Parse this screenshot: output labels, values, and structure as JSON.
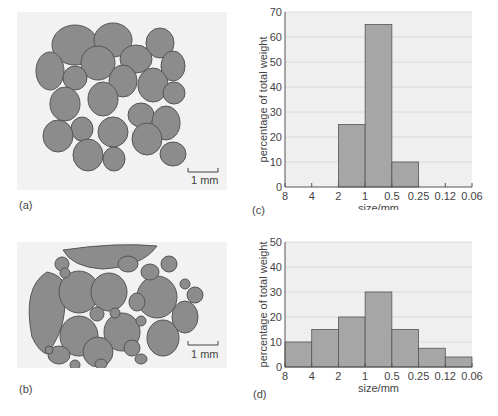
{
  "panels": {
    "a": {
      "label": "(a)",
      "scale_bar": "1 mm",
      "description": "well-sorted grains"
    },
    "b": {
      "label": "(b)",
      "scale_bar": "1 mm",
      "description": "poorly-sorted grains"
    },
    "c": {
      "label": "(c)"
    },
    "d": {
      "label": "(d)"
    }
  },
  "chart_data": [
    {
      "type": "bar",
      "panel": "(c)",
      "title": "",
      "xlabel": "size/mm",
      "ylabel": "percentage of total weight",
      "x_ticks": [
        "8",
        "4",
        "2",
        "1",
        "0.5",
        "0.25",
        "0.12",
        "0.06"
      ],
      "categories": [
        "8-4",
        "4-2",
        "2-1",
        "1-0.5",
        "0.5-0.25",
        "0.25-0.12",
        "0.12-0.06"
      ],
      "values": [
        0,
        0,
        25,
        65,
        10,
        0,
        0
      ],
      "ylim": [
        0,
        70
      ],
      "y_ticks": [
        0,
        10,
        20,
        30,
        40,
        50,
        60,
        70
      ],
      "grid": true
    },
    {
      "type": "bar",
      "panel": "(d)",
      "title": "",
      "xlabel": "size/mm",
      "ylabel": "percentage of total weight",
      "x_ticks": [
        "8",
        "4",
        "2",
        "1",
        "0.5",
        "0.25",
        "0.12",
        "0.06"
      ],
      "categories": [
        "8-4",
        "4-2",
        "2-1",
        "1-0.5",
        "0.5-0.25",
        "0.25-0.12",
        "0.12-0.06"
      ],
      "values": [
        10,
        15,
        20,
        30,
        15,
        7.5,
        4
      ],
      "ylim": [
        0,
        50
      ],
      "y_ticks": [
        0,
        10,
        20,
        30,
        40,
        50
      ],
      "grid": true
    }
  ],
  "colors": {
    "bar": "#a6a6a6",
    "bar_edge": "#555555",
    "plot_bg": "#efefef",
    "grid": "#ffffff",
    "grain": "#8c8c8c"
  }
}
